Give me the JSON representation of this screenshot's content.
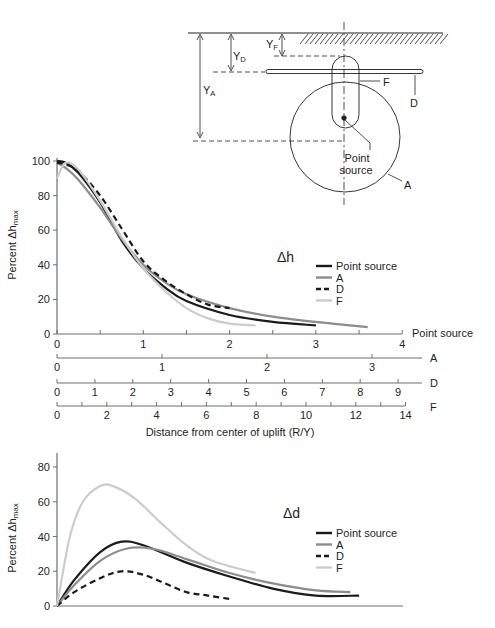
{
  "diagram": {
    "labels": {
      "yf": "Y",
      "yf_sub": "F",
      "yd": "Y",
      "yd_sub": "D",
      "ya": "Y",
      "ya_sub": "A",
      "f": "F",
      "d": "D",
      "a": "A",
      "point_source_line1": "Point",
      "point_source_line2": "source"
    }
  },
  "chart_data": [
    {
      "type": "line",
      "title": "Δh",
      "ylabel": "Percent Δh",
      "ylabel_sub": "max",
      "xlabel": "Distance from center of uplift (R/Y)",
      "ylim": [
        0,
        100
      ],
      "yticks": [
        0,
        20,
        40,
        60,
        80,
        100
      ],
      "grid": false,
      "legend_position": "right-center",
      "legend": [
        "Point source",
        "A",
        "D",
        "F"
      ],
      "x_axes": [
        {
          "name": "Point source",
          "ticks": [
            0,
            1,
            2,
            3,
            4
          ],
          "minor_step": 0.5,
          "range": [
            0,
            4
          ]
        },
        {
          "name": "A",
          "ticks": [
            0,
            1,
            2,
            3
          ],
          "range": [
            0,
            3.5
          ]
        },
        {
          "name": "D",
          "ticks": [
            0,
            1,
            2,
            3,
            4,
            5,
            6,
            7,
            8,
            9
          ],
          "range": [
            0,
            9.5
          ]
        },
        {
          "name": "F",
          "ticks": [
            0,
            2,
            4,
            6,
            8,
            10,
            12,
            14
          ],
          "minor_step": 1,
          "range": [
            0,
            14
          ]
        }
      ],
      "series": [
        {
          "name": "Point source",
          "style": "solid",
          "color": "#1a1a1a",
          "x": [
            0,
            0.1,
            0.25,
            0.5,
            0.75,
            1.0,
            1.25,
            1.5,
            2.0,
            2.5,
            3.0
          ],
          "values": [
            100,
            99,
            93,
            76,
            54,
            38,
            27,
            19,
            11,
            7,
            5
          ]
        },
        {
          "name": "A",
          "style": "solid",
          "color": "#8c8c8c",
          "x": [
            0,
            0.1,
            0.25,
            0.5,
            0.75,
            1.0,
            1.25,
            1.5,
            2.0,
            2.5,
            3.0,
            3.6
          ],
          "values": [
            99,
            96,
            89,
            73,
            55,
            40,
            30,
            23,
            15,
            10,
            7,
            4
          ]
        },
        {
          "name": "D",
          "style": "dashed",
          "color": "#1a1a1a",
          "x": [
            0,
            0.1,
            0.25,
            0.5,
            0.75,
            1.0,
            1.25,
            1.5,
            1.75,
            2.0
          ],
          "values": [
            99,
            98,
            94,
            80,
            61,
            42,
            31,
            23,
            17,
            15
          ]
        },
        {
          "name": "F",
          "style": "solid",
          "color": "#cccccc",
          "x": [
            0,
            0.1,
            0.25,
            0.5,
            0.75,
            1.0,
            1.25,
            1.5,
            1.75,
            2.0,
            2.3
          ],
          "values": [
            90,
            99,
            95,
            77,
            56,
            38,
            25,
            15,
            9,
            6,
            5
          ]
        }
      ]
    },
    {
      "type": "line",
      "title": "Δd",
      "ylabel": "Percent Δh",
      "ylabel_sub": "max",
      "xlabel": "",
      "ylim": [
        0,
        85
      ],
      "yticks": [
        0,
        20,
        40,
        60,
        80
      ],
      "grid": false,
      "legend_position": "right-center",
      "legend": [
        "Point source",
        "A",
        "D",
        "F"
      ],
      "x_range": [
        0,
        4
      ],
      "series": [
        {
          "name": "Point source",
          "style": "solid",
          "color": "#1a1a1a",
          "x": [
            0,
            0.2,
            0.5,
            0.75,
            1.0,
            1.5,
            2.0,
            2.5,
            3.0,
            3.5
          ],
          "values": [
            0,
            15,
            31,
            37,
            35,
            25,
            17,
            10,
            6,
            6
          ]
        },
        {
          "name": "A",
          "style": "solid",
          "color": "#8c8c8c",
          "x": [
            0,
            0.2,
            0.5,
            0.8,
            1.1,
            1.5,
            2.0,
            2.5,
            3.0,
            3.4
          ],
          "values": [
            0,
            12,
            26,
            33,
            33,
            27,
            19,
            13,
            9,
            8
          ]
        },
        {
          "name": "D",
          "style": "dashed",
          "color": "#1a1a1a",
          "x": [
            0,
            0.2,
            0.5,
            0.75,
            1.0,
            1.25,
            1.5,
            1.75,
            2.0
          ],
          "values": [
            0,
            8,
            16,
            20,
            18,
            13,
            8,
            6,
            4
          ]
        },
        {
          "name": "F",
          "style": "solid",
          "color": "#cccccc",
          "x": [
            0,
            0.15,
            0.3,
            0.5,
            0.65,
            0.9,
            1.2,
            1.5,
            1.8,
            2.3
          ],
          "values": [
            0,
            40,
            60,
            69,
            69,
            62,
            48,
            35,
            26,
            19
          ]
        }
      ]
    }
  ]
}
